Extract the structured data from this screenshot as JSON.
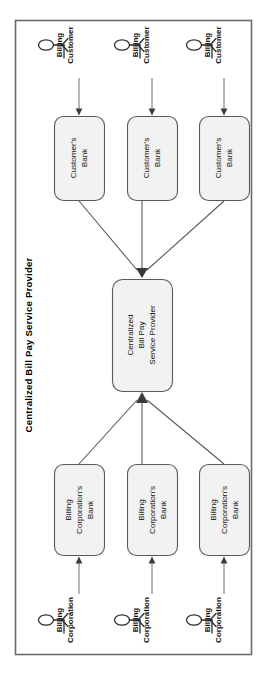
{
  "diagram": {
    "title": "Centralized Bill Pay Service Provider",
    "orientation": "rotated-90-ccw",
    "frame": {
      "border_color": "#6b6b6b",
      "fill_color": "#ffffff"
    },
    "node_fill_color": "#f2f2f2",
    "node_stroke_color": "#5a5a5a",
    "connector_color": "#5a5a5a",
    "top_actors": [
      {
        "id": "billing-customer-1",
        "line1": "Billing",
        "line2": "Customer"
      },
      {
        "id": "billing-customer-2",
        "line1": "Billing",
        "line2": "Customer"
      },
      {
        "id": "billing-customer-3",
        "line1": "Billing",
        "line2": "Customer"
      }
    ],
    "customer_banks": [
      {
        "id": "customers-bank-1",
        "line1": "Customer's",
        "line2": "Bank"
      },
      {
        "id": "customers-bank-2",
        "line1": "Customer's",
        "line2": "Bank"
      },
      {
        "id": "customers-bank-3",
        "line1": "Customer's",
        "line2": "Bank"
      }
    ],
    "hub": {
      "id": "centralized-bill-pay-service-provider",
      "line1": "Centralized",
      "line2": "Bill Pay",
      "line3": "Service Provider"
    },
    "corporation_banks": [
      {
        "id": "billing-corporations-bank-1",
        "line1": "Billing",
        "line2": "Corporation's",
        "line3": "Bank"
      },
      {
        "id": "billing-corporations-bank-2",
        "line1": "Billing",
        "line2": "Corporation's",
        "line3": "Bank"
      },
      {
        "id": "billing-corporations-bank-3",
        "line1": "Billing",
        "line2": "Corporation's",
        "line3": "Bank"
      }
    ],
    "bottom_actors": [
      {
        "id": "billing-corporation-1",
        "line1": "Billing",
        "line2": "Corporation"
      },
      {
        "id": "billing-corporation-2",
        "line1": "Billing",
        "line2": "Corporation"
      },
      {
        "id": "billing-corporation-3",
        "line1": "Billing",
        "line2": "Corporation"
      }
    ]
  }
}
